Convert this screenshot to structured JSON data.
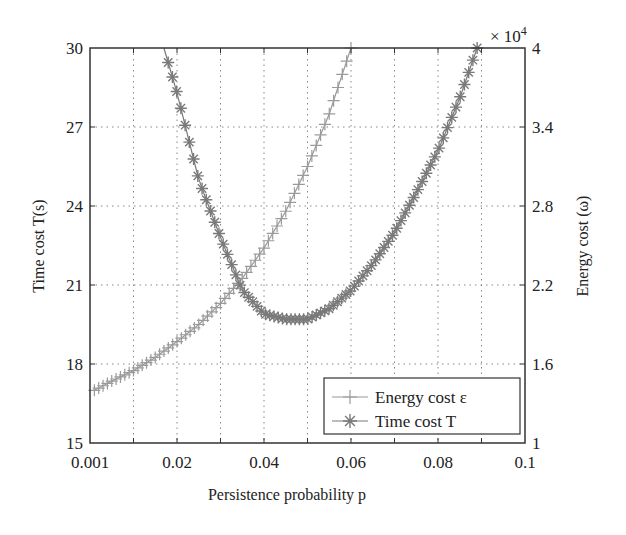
{
  "chart_data": {
    "type": "line",
    "title": "",
    "xlabel": "Persistence probability p",
    "ylabel": "Time cost T(s)",
    "ylabel_right": "Energy cost (ω)",
    "right_axis_multiplier": "× 10^4",
    "xlim": [
      0.001,
      0.1
    ],
    "ylim": [
      15,
      30
    ],
    "ylim_right": [
      1,
      4
    ],
    "x_ticks": [
      "0.001",
      "0.02",
      "0.04",
      "0.06",
      "0.08",
      "0.1"
    ],
    "y_ticks": [
      "15",
      "18",
      "21",
      "24",
      "27",
      "30"
    ],
    "y_ticks_right": [
      "1",
      "1.6",
      "2.2",
      "2.8",
      "3.4",
      "4"
    ],
    "grid": true,
    "legend_position": "lower right",
    "series": [
      {
        "name": "Energy cost ε",
        "axis": "right",
        "marker": "+",
        "color": "#9a9a9a",
        "x": [
          0.001,
          0.005,
          0.01,
          0.015,
          0.02,
          0.025,
          0.03,
          0.035,
          0.04,
          0.045,
          0.05,
          0.055,
          0.06
        ],
        "values": [
          1.4,
          1.47,
          1.55,
          1.65,
          1.77,
          1.9,
          2.06,
          2.25,
          2.48,
          2.76,
          3.1,
          3.5,
          4.0
        ]
      },
      {
        "name": "Time cost T",
        "axis": "left",
        "marker": "*",
        "color": "#7a7a7a",
        "x": [
          0.017,
          0.02,
          0.025,
          0.03,
          0.035,
          0.04,
          0.045,
          0.05,
          0.055,
          0.06,
          0.065,
          0.07,
          0.075,
          0.08,
          0.085,
          0.089
        ],
        "values": [
          30.0,
          28.3,
          25.0,
          22.8,
          20.8,
          19.9,
          19.7,
          19.7,
          20.1,
          20.8,
          21.8,
          23.0,
          24.5,
          26.1,
          28.1,
          30.0
        ]
      }
    ]
  },
  "legend": {
    "items": [
      {
        "label": "Energy cost ε",
        "marker": "+"
      },
      {
        "label": "Time cost T",
        "marker": "*"
      }
    ]
  }
}
